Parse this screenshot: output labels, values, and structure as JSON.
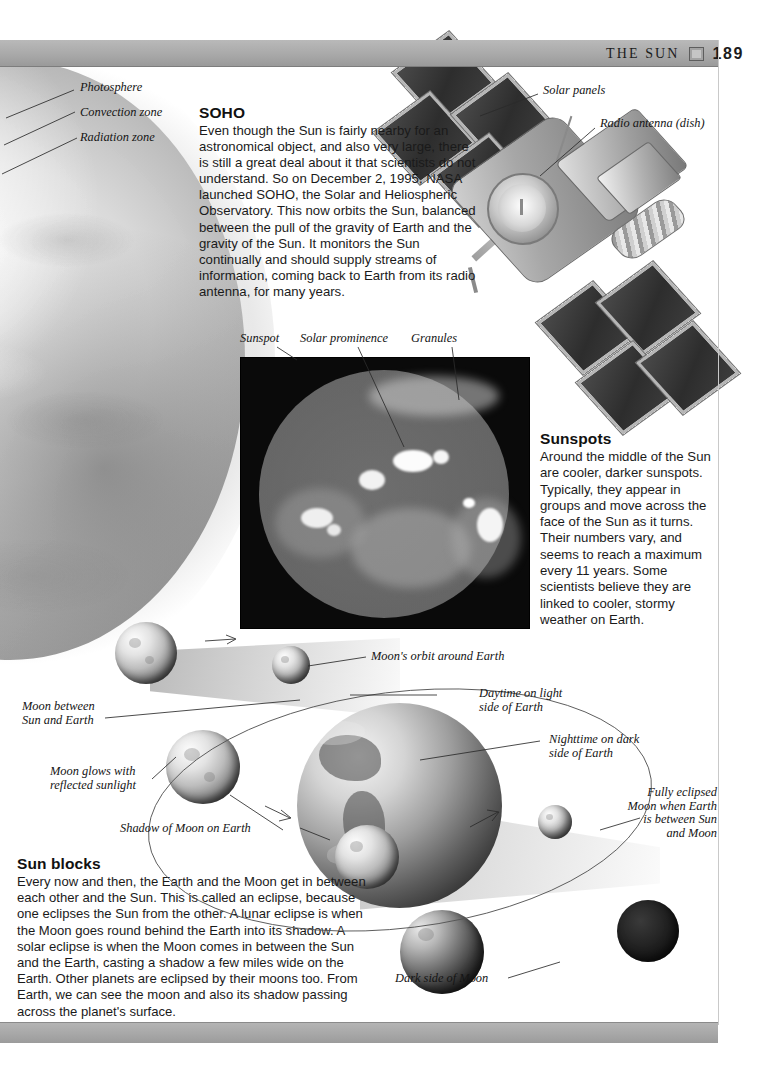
{
  "header": {
    "title": "The Sun",
    "title_display": "THE SUN",
    "page_number": "189",
    "icon": "book-square-icon"
  },
  "sun_cutaway_labels": [
    {
      "text": "Photosphere"
    },
    {
      "text": "Convection zone"
    },
    {
      "text": "Radiation zone"
    }
  ],
  "satellite_labels": [
    {
      "text": "Solar panels"
    },
    {
      "text": "Radio antenna (dish)"
    }
  ],
  "soho": {
    "heading": "SOHO",
    "body": "Even though the Sun is fairly nearby for an astronomical object, and also very large, there is still a great deal about it that scientists do not understand. So on December 2, 1995, NASA launched SOHO, the Solar and Heliospheric Observatory. This now orbits the Sun, balanced between the pull of the gravity of Earth and the gravity of the Sun. It monitors the Sun continually and should supply streams of information, coming back to Earth from its radio antenna, for many years."
  },
  "sun_photo_labels": [
    {
      "text": "Sunspot"
    },
    {
      "text": "Solar prominence"
    },
    {
      "text": "Granules"
    }
  ],
  "sunspots": {
    "heading": "Sunspots",
    "body": "Around the middle of the Sun are cooler, darker sunspots. Typically, they appear in groups and move across the face of the Sun as it turns. Their numbers vary, and seems to reach a maximum every 11 years. Some scientists believe they are linked to cooler, stormy weather on Earth."
  },
  "eclipse_labels": {
    "moon_between": "Moon between\nSun and Earth",
    "moon_glows": "Moon glows with\nreflected sunlight",
    "shadow_of_moon": "Shadow of Moon on Earth",
    "moons_orbit": "Moon's orbit around Earth",
    "daytime": "Daytime on light\nside of Earth",
    "nighttime": "Nighttime on dark\nside of Earth",
    "fully_eclipsed": "Fully eclipsed\nMoon when Earth\nis between Sun\nand Moon",
    "dark_side": "Dark side of Moon"
  },
  "sun_blocks": {
    "heading": "Sun blocks",
    "body": "Every now and then, the Earth and the Moon get in between each other and the Sun. This is called an eclipse, because one eclipses the Sun from the other.  A lunar eclipse is when the Moon goes round behind the Earth into its shadow.  A solar eclipse is when the Moon comes in between the Sun and the Earth, casting a shadow a few miles wide on the Earth. Other planets are eclipsed by their moons too. From Earth, we can see the moon and also its shadow passing across the planet's surface."
  },
  "colors": {
    "header_bar": "#a9a9a9",
    "rule": "#7d7d7d",
    "text": "#1a1a1a"
  }
}
